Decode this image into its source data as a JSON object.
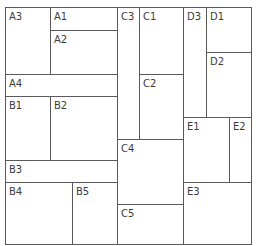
{
  "diagram": {
    "type": "treemap-layout",
    "border_color": "#5a5a5a",
    "label_color": "#3c3c3c",
    "background": "#ffffff",
    "cells": [
      {
        "label": "A3",
        "x": 5,
        "y": 7,
        "w": 46,
        "h": 68
      },
      {
        "label": "A1",
        "x": 50,
        "y": 7,
        "w": 68,
        "h": 24
      },
      {
        "label": "A2",
        "x": 50,
        "y": 30,
        "w": 68,
        "h": 45
      },
      {
        "label": "A4",
        "x": 5,
        "y": 74,
        "w": 113,
        "h": 23
      },
      {
        "label": "B1",
        "x": 5,
        "y": 96,
        "w": 46,
        "h": 65
      },
      {
        "label": "B2",
        "x": 50,
        "y": 96,
        "w": 68,
        "h": 65
      },
      {
        "label": "B3",
        "x": 5,
        "y": 160,
        "w": 113,
        "h": 23
      },
      {
        "label": "B4",
        "x": 5,
        "y": 182,
        "w": 68,
        "h": 63
      },
      {
        "label": "B5",
        "x": 72,
        "y": 182,
        "w": 46,
        "h": 63
      },
      {
        "label": "C3",
        "x": 117,
        "y": 7,
        "w": 23,
        "h": 133
      },
      {
        "label": "C1",
        "x": 139,
        "y": 7,
        "w": 45,
        "h": 68
      },
      {
        "label": "C2",
        "x": 139,
        "y": 74,
        "w": 45,
        "h": 66
      },
      {
        "label": "C4",
        "x": 117,
        "y": 139,
        "w": 67,
        "h": 66
      },
      {
        "label": "C5",
        "x": 117,
        "y": 204,
        "w": 67,
        "h": 41
      },
      {
        "label": "D3",
        "x": 183,
        "y": 7,
        "w": 24,
        "h": 111
      },
      {
        "label": "D1",
        "x": 206,
        "y": 7,
        "w": 46,
        "h": 46
      },
      {
        "label": "D2",
        "x": 206,
        "y": 52,
        "w": 46,
        "h": 66
      },
      {
        "label": "E1",
        "x": 183,
        "y": 117,
        "w": 47,
        "h": 66
      },
      {
        "label": "E2",
        "x": 229,
        "y": 117,
        "w": 23,
        "h": 66
      },
      {
        "label": "E3",
        "x": 183,
        "y": 182,
        "w": 69,
        "h": 63
      }
    ]
  }
}
